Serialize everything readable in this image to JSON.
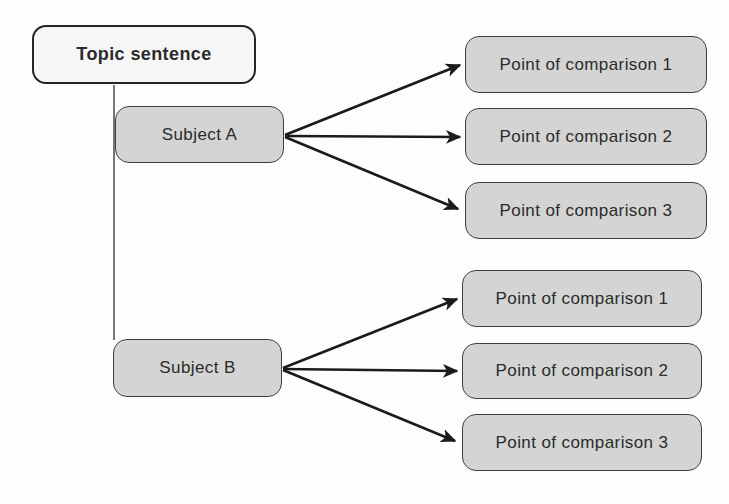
{
  "diagram": {
    "type": "comparison-contrast-outline",
    "topic_label": "Topic sentence",
    "subjects": [
      {
        "label": "Subject A",
        "points": [
          "Point of comparison 1",
          "Point of comparison 2",
          "Point of comparison 3"
        ]
      },
      {
        "label": "Subject B",
        "points": [
          "Point of comparison 1",
          "Point of comparison 2",
          "Point of comparison 3"
        ]
      }
    ],
    "colors": {
      "topic_fill": "#f6f6f6",
      "node_fill": "#d4d4d4",
      "node_border": "#3f3f3f",
      "topic_border": "#242424",
      "arrow": "#1b1b1b",
      "trunk_line": "#4a4a4a",
      "text": "#2b2b2b",
      "background": "#fdfdfd"
    }
  }
}
